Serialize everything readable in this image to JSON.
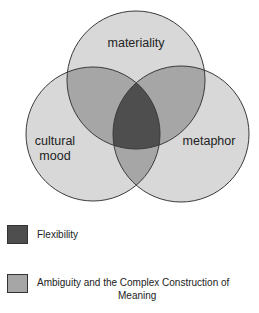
{
  "diagram": {
    "type": "venn",
    "circles": [
      {
        "id": "materiality",
        "label": "materiality",
        "cx": 136,
        "cy": 80,
        "r": 69
      },
      {
        "id": "cultural-mood",
        "label_lines": [
          "cultural",
          "mood"
        ],
        "cx": 93,
        "cy": 134,
        "r": 67
      },
      {
        "id": "metaphor",
        "label": "metaphor",
        "cx": 181,
        "cy": 134,
        "r": 68
      }
    ],
    "colors": {
      "circle_fill": "#d8d8d8",
      "pair_overlap_fill": "#a6a6a6",
      "center_fill": "#4e4e4e",
      "stroke": "#3a3a3a"
    }
  },
  "legend": {
    "items": [
      {
        "label": "Flexibility",
        "color": "#4e4e4e"
      },
      {
        "label_lines": [
          "Ambiguity and the Complex Construction of",
          "Meaning"
        ],
        "color": "#a6a6a6"
      }
    ]
  }
}
